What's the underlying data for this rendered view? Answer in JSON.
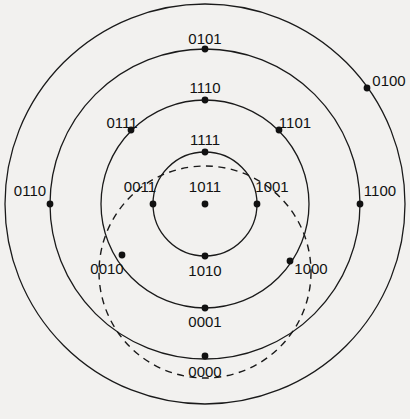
{
  "figure": {
    "kind": "concentric-ring-node-diagram",
    "background_color": "#f2f1ef",
    "stroke_color": "#1a1a1a",
    "dot_color": "#111111",
    "width": 410,
    "height": 419,
    "center": {
      "x": 205,
      "y": 204
    }
  },
  "rings": [
    {
      "id": "ring-1",
      "name": "inner-ring",
      "radius": 52,
      "style": "solid"
    },
    {
      "id": "ring-2",
      "name": "second-ring",
      "radius": 104,
      "style": "solid"
    },
    {
      "id": "ring-3",
      "name": "third-ring",
      "radius": 155,
      "style": "solid"
    },
    {
      "id": "ring-4",
      "name": "outer-ring",
      "radius": 200,
      "style": "solid"
    }
  ],
  "dashed_circle": {
    "id": "dashed-circle",
    "name": "dashed-overlay-circle",
    "cx": 205,
    "cy": 272,
    "radius": 106,
    "style": "dashed"
  },
  "nodes": [
    {
      "id": "n-1011",
      "label": "1011",
      "dot": {
        "x": 205,
        "y": 204
      },
      "label_pos": {
        "x": 205,
        "y": 186
      },
      "ring": "center"
    },
    {
      "id": "n-1111",
      "label": "1111",
      "dot": {
        "x": 205,
        "y": 152
      },
      "label_pos": {
        "x": 205,
        "y": 139
      },
      "ring": "ring-1"
    },
    {
      "id": "n-0011",
      "label": "0011",
      "dot": {
        "x": 153,
        "y": 204
      },
      "label_pos": {
        "x": 140,
        "y": 186
      },
      "ring": "ring-1"
    },
    {
      "id": "n-1001",
      "label": "1001",
      "dot": {
        "x": 257,
        "y": 204
      },
      "label_pos": {
        "x": 272,
        "y": 186
      },
      "ring": "ring-1"
    },
    {
      "id": "n-1010",
      "label": "1010",
      "dot": {
        "x": 205,
        "y": 256
      },
      "label_pos": {
        "x": 205,
        "y": 270
      },
      "ring": "ring-1"
    },
    {
      "id": "n-1110",
      "label": "1110",
      "dot": {
        "x": 205,
        "y": 100
      },
      "label_pos": {
        "x": 205,
        "y": 87
      },
      "ring": "ring-2"
    },
    {
      "id": "n-0111",
      "label": "0111",
      "dot": {
        "x": 131,
        "y": 130
      },
      "label_pos": {
        "x": 122,
        "y": 122
      },
      "ring": "ring-2"
    },
    {
      "id": "n-1101",
      "label": "1101",
      "dot": {
        "x": 279,
        "y": 130
      },
      "label_pos": {
        "x": 295,
        "y": 122
      },
      "ring": "ring-2"
    },
    {
      "id": "n-0001",
      "label": "0001",
      "dot": {
        "x": 205,
        "y": 308
      },
      "label_pos": {
        "x": 205,
        "y": 321
      },
      "ring": "ring-2"
    },
    {
      "id": "n-0101",
      "label": "0101",
      "dot": {
        "x": 205,
        "y": 49
      },
      "label_pos": {
        "x": 205,
        "y": 38
      },
      "ring": "ring-3"
    },
    {
      "id": "n-0110",
      "label": "0110",
      "dot": {
        "x": 50,
        "y": 204
      },
      "label_pos": {
        "x": 30,
        "y": 190
      },
      "ring": "ring-3"
    },
    {
      "id": "n-1100",
      "label": "1100",
      "dot": {
        "x": 360,
        "y": 204
      },
      "label_pos": {
        "x": 380,
        "y": 190
      },
      "ring": "ring-3"
    },
    {
      "id": "n-0010",
      "label": "0010",
      "dot": {
        "x": 122,
        "y": 255
      },
      "label_pos": {
        "x": 107,
        "y": 268
      },
      "ring": "ring-3"
    },
    {
      "id": "n-1000",
      "label": "1000",
      "dot": {
        "x": 290,
        "y": 261
      },
      "label_pos": {
        "x": 311,
        "y": 268
      },
      "ring": "ring-3"
    },
    {
      "id": "n-0000",
      "label": "0000",
      "dot": {
        "x": 205,
        "y": 356
      },
      "label_pos": {
        "x": 205,
        "y": 371
      },
      "ring": "ring-3"
    },
    {
      "id": "n-0100",
      "label": "0100",
      "dot": {
        "x": 367,
        "y": 88
      },
      "label_pos": {
        "x": 389,
        "y": 80
      },
      "ring": "ring-4"
    }
  ]
}
